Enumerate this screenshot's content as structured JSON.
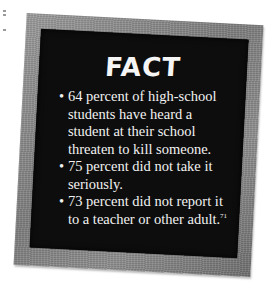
{
  "card": {
    "title": "FACT",
    "bullet": "•",
    "facts": [
      {
        "text": "64 percent of high-school students have heard a student at their school threaten to kill someone."
      },
      {
        "text": "75 percent did not take it seriously."
      },
      {
        "text": "73 percent did not report it to a teacher or other adult.",
        "reference": "71"
      }
    ]
  },
  "colors": {
    "board": "#0d0d0d",
    "frame": "#8a8a8a",
    "text": "#f2f2f2",
    "page": "#ffffff"
  }
}
